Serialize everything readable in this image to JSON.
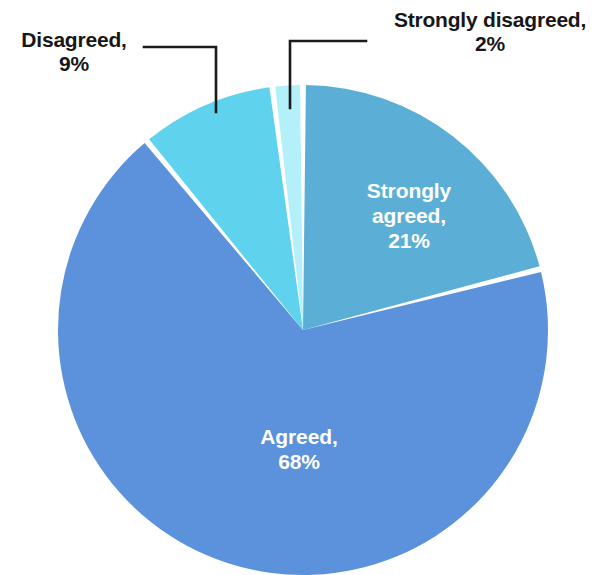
{
  "chart_data": {
    "type": "pie",
    "title": "",
    "categories": [
      "Strongly agreed",
      "Agreed",
      "Disagreed",
      "Strongly disagreed"
    ],
    "values": [
      21,
      68,
      9,
      2
    ],
    "unit": "%",
    "start_angle_deg": 0,
    "direction": "clockwise",
    "legend": "none",
    "slice_gap": true,
    "colors": [
      "#5BAFD6",
      "#5B92DB",
      "#5FD3EE",
      "#B4F0FA"
    ],
    "slices": [
      {
        "name": "Strongly agreed",
        "value": 21,
        "label_line1": "Strongly",
        "label_line2": "agreed,",
        "label_line3": "21%",
        "color": "#5BAFD6",
        "label_placement": "inside",
        "label_color": "#ffffff"
      },
      {
        "name": "Agreed",
        "value": 68,
        "label_line1": "Agreed,",
        "label_line2": "68%",
        "color": "#5B92DB",
        "label_placement": "inside",
        "label_color": "#ffffff"
      },
      {
        "name": "Disagreed",
        "value": 9,
        "label_line1": "Disagreed,",
        "label_line2": "9%",
        "color": "#5FD3EE",
        "label_placement": "outside",
        "label_color": "#171717"
      },
      {
        "name": "Strongly disagreed",
        "value": 2,
        "label_line1": "Strongly disagreed,",
        "label_line2": "2%",
        "color": "#B4F0FA",
        "label_placement": "outside",
        "label_color": "#171717"
      }
    ]
  },
  "canvas": {
    "background": "#ffffff",
    "center_x": 303,
    "center_y": 330,
    "radius": 245,
    "leader_color": "#1a1a1a"
  }
}
